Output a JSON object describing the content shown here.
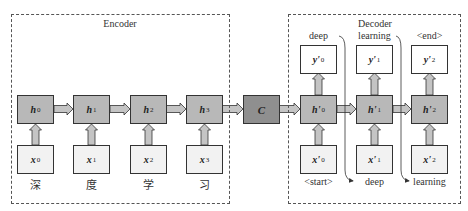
{
  "encoder": {
    "title": "Encoder",
    "hidden_states": [
      {
        "name": "h",
        "sub": "0"
      },
      {
        "name": "h",
        "sub": "1"
      },
      {
        "name": "h",
        "sub": "2"
      },
      {
        "name": "h",
        "sub": "3"
      }
    ],
    "inputs": [
      {
        "name": "x",
        "sub": "0",
        "token": "深"
      },
      {
        "name": "x",
        "sub": "1",
        "token": "度"
      },
      {
        "name": "x",
        "sub": "2",
        "token": "学"
      },
      {
        "name": "x",
        "sub": "3",
        "token": "习"
      }
    ]
  },
  "context": {
    "name": "C"
  },
  "decoder": {
    "title": "Decoder",
    "hidden_states": [
      {
        "name": "h'",
        "sub": "0"
      },
      {
        "name": "h'",
        "sub": "1"
      },
      {
        "name": "h'",
        "sub": "2"
      }
    ],
    "outputs": [
      {
        "name": "y'",
        "sub": "0",
        "token": "deep"
      },
      {
        "name": "y'",
        "sub": "1",
        "token": "learning"
      },
      {
        "name": "y'",
        "sub": "2",
        "token": "<end>"
      }
    ],
    "inputs": [
      {
        "name": "x'",
        "sub": "0",
        "token": "<start>"
      },
      {
        "name": "x'",
        "sub": "1",
        "token": "deep"
      },
      {
        "name": "x'",
        "sub": "2",
        "token": "learning"
      }
    ]
  },
  "colors": {
    "hidden_fill": "#b8b8b8",
    "context_fill": "#8f8f8f",
    "input_fill": "#f2f2f2",
    "output_fill": "#ffffff",
    "arrow_fill": "#c4c4c4",
    "stroke": "#333333"
  }
}
